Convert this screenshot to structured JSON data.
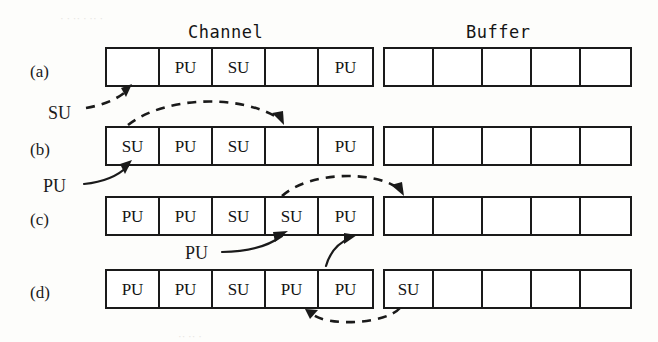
{
  "figure": {
    "headings": {
      "channel": "Channel",
      "buffer": "Buffer"
    },
    "rows": [
      {
        "label": "(a)",
        "channel": [
          "",
          "PU",
          "SU",
          "",
          "PU"
        ],
        "buffer": [
          "",
          "",
          "",
          "",
          ""
        ]
      },
      {
        "label": "(b)",
        "channel": [
          "SU",
          "PU",
          "SU",
          "",
          "PU"
        ],
        "buffer": [
          "",
          "",
          "",
          "",
          ""
        ]
      },
      {
        "label": "(c)",
        "channel": [
          "PU",
          "PU",
          "SU",
          "SU",
          "PU"
        ],
        "buffer": [
          "",
          "",
          "",
          "",
          ""
        ]
      },
      {
        "label": "(d)",
        "channel": [
          "PU",
          "PU",
          "SU",
          "PU",
          "PU"
        ],
        "buffer": [
          "SU",
          "",
          "",
          "",
          ""
        ]
      }
    ],
    "captions": [
      {
        "id": "su-arrival",
        "text": "SU"
      },
      {
        "id": "pu-arrival-b",
        "text": "PU"
      },
      {
        "id": "pu-arrival-c",
        "text": "PU"
      },
      {
        "id": "pu-arrival-d",
        "text": "PU"
      }
    ],
    "colors": {
      "ink": "#1a1a1a",
      "page": "#fdfdfb",
      "cell_fill": "#ffffff"
    }
  }
}
